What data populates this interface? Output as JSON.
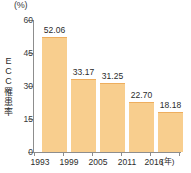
{
  "chart_data": {
    "type": "bar",
    "title": "",
    "subtitle": "",
    "categories": [
      "1993",
      "1999",
      "2005",
      "2011",
      "2016"
    ],
    "values": [
      52.06,
      33.17,
      31.25,
      22.7,
      18.18
    ],
    "value_labels": [
      "52.06",
      "33.17",
      "31.25",
      "22.70",
      "18.18"
    ],
    "xlabel": "(年)",
    "ylabel": "ECC罹患率",
    "ylabel_chars": [
      "E",
      "C",
      "C",
      "罹",
      "患",
      "率"
    ],
    "yunit": "(%)",
    "ylim": [
      0,
      60
    ],
    "yticks": [
      60,
      45,
      30,
      15,
      0
    ],
    "ytick_labels": [
      "60",
      "45",
      "30",
      "15",
      "0"
    ],
    "grid": false,
    "legend": null,
    "series": [
      {
        "name": "ECC罹患率",
        "values": [
          52.06,
          33.17,
          31.25,
          22.7,
          18.18
        ]
      }
    ],
    "colors": {
      "bar_fill": "#f8ce8e",
      "bar_edge": "#eeae5e",
      "axis": "#8d8d8d",
      "text": "#2b2b2b",
      "background": "#ffffff"
    }
  }
}
